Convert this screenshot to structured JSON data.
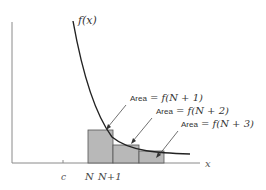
{
  "diagram": {
    "function_label": "f(x)",
    "x_axis_label": "x",
    "tick_labels": {
      "c": "c",
      "N": "N",
      "N_plus_1": "N+1"
    },
    "annotations": [
      {
        "prefix": "Area",
        "expr": "= f(N + 1)"
      },
      {
        "prefix": "Area",
        "expr": "= f(N + 2)"
      },
      {
        "prefix": "Area",
        "expr": "= f(N + 3)"
      }
    ],
    "colors": {
      "axis": "#8a8a8a",
      "curve": "#222222",
      "rect_fill": "#b8b8b8",
      "rect_stroke": "#555555",
      "text": "#333333"
    }
  }
}
